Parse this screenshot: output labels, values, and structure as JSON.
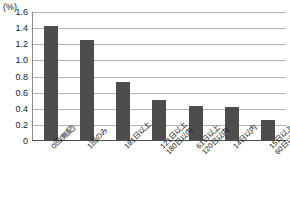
{
  "axis": {
    "unit_label": "(%)",
    "y_ticks": [
      "1.6",
      "1.4",
      "1.2",
      "1.0",
      "0.8",
      "0.6",
      "0.4",
      "0.2",
      "0"
    ],
    "y_min": 0,
    "y_max": 1.6,
    "y_step": 0.2
  },
  "colors": {
    "bar": "#4d4d4d",
    "gridline": "#b3b3b3",
    "axis": "#4d4d4d",
    "text": "#1a1a1a",
    "background": "#ffffff"
  },
  "chart_data": {
    "type": "bar",
    "title": "",
    "subtitle": "",
    "xlabel": "",
    "ylabel": "(%)",
    "ylim": [
      0,
      1.6
    ],
    "ytick_values": [
      0,
      0.2,
      0.4,
      0.6,
      0.8,
      1.0,
      1.2,
      1.4,
      1.6
    ],
    "grid": true,
    "legend": false,
    "categories": [
      "0回(無配)",
      "1回のみ",
      "181日以上",
      "121日以上\n180日以内",
      "61日以上\n120日以内",
      "14日以内",
      "15日以上\n60日以内"
    ],
    "category_lines": [
      [
        "0回(無配)",
        ""
      ],
      [
        "1回のみ",
        ""
      ],
      [
        "181日以上",
        ""
      ],
      [
        "121日以上",
        "180日以内"
      ],
      [
        "61日以上",
        "120日以内"
      ],
      [
        "14日以内",
        ""
      ],
      [
        "15日以上",
        "60日以内"
      ]
    ],
    "values": [
      1.41,
      1.24,
      0.72,
      0.5,
      0.42,
      0.41,
      0.25
    ]
  }
}
